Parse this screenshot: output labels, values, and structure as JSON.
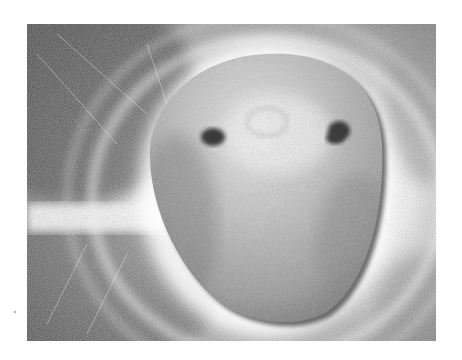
{
  "image": {
    "description": "Grayscale close-up photograph of an egg-shaped stone with two dark spots resembling eyes, resting on a scratched metallic surface with a bright circular reflection halo",
    "border_color": "#ffffff",
    "frame": {
      "x": 27,
      "y": 24,
      "width": 409,
      "height": 317
    },
    "colors": {
      "background_dark": "#4a4a4a",
      "background_mid": "#8a8a8a",
      "halo": "#ffffff",
      "stone_light": "#d8d8d8",
      "stone_mid": "#a8a8a8",
      "stone_shadow": "#6a6a6a",
      "spots": "#3a3a3a"
    },
    "stone": {
      "cx": 266,
      "cy": 187,
      "rx": 116,
      "ry": 135
    },
    "spots": [
      {
        "name": "left-spot",
        "cx": 213,
        "cy": 137
      },
      {
        "name": "right-spot",
        "cx": 339,
        "cy": 132
      }
    ]
  }
}
